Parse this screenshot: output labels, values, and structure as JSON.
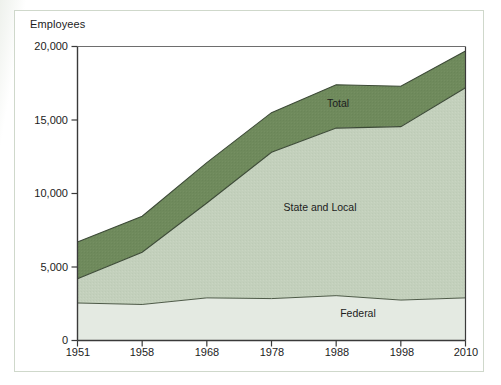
{
  "figure": {
    "axis_title": "Employees"
  },
  "chart_data": {
    "type": "area",
    "title": "Employees",
    "subtitle": "",
    "xlabel": "",
    "ylabel": "Employees",
    "stacked": true,
    "grid": false,
    "legend_position": "inline-annotations",
    "x": [
      1951,
      1958,
      1968,
      1978,
      1988,
      1998,
      2010
    ],
    "xtick_labels": [
      "1951",
      "1958",
      "1968",
      "1978",
      "1988",
      "1998",
      "2010"
    ],
    "xlim": [
      1951,
      2010
    ],
    "ylim": [
      0,
      20000
    ],
    "ytick_labels": [
      "0",
      "5,000",
      "10,000",
      "15,000",
      "20,000"
    ],
    "ytick_values": [
      0,
      5000,
      10000,
      15000,
      20000
    ],
    "series": [
      {
        "name": "Federal",
        "color": "#e4eae2",
        "values": [
          2550,
          2450,
          2900,
          2850,
          3050,
          2750,
          2900
        ]
      },
      {
        "name": "State and Local",
        "color": "#c3d0bc",
        "values": [
          1650,
          3550,
          6450,
          9950,
          11400,
          11800,
          14300
        ]
      },
      {
        "name": "Total",
        "color": "#6f8a5c",
        "values": [
          2500,
          2450,
          2750,
          2700,
          2950,
          2750,
          2500
        ]
      }
    ],
    "cumulative": {
      "federal_top": [
        2550,
        2450,
        2900,
        2850,
        3050,
        2750,
        2900
      ],
      "state_and_local_top": [
        4200,
        6000,
        9350,
        12800,
        14450,
        14550,
        17200
      ],
      "total_top": [
        6700,
        8450,
        12100,
        15500,
        17400,
        17300,
        19700
      ]
    },
    "annotations": [
      {
        "text": "Total",
        "x": 1983,
        "y": 16000
      },
      {
        "text": "State and Local",
        "x": 1981,
        "y": 9600
      },
      {
        "text": "Federal",
        "x": 1992,
        "y": 1300
      }
    ],
    "colors": {
      "total_band": "#6f8a5c",
      "state_and_local_band": "#c3d0bc",
      "federal_band": "#e4eae2",
      "axis": "#3a3a3a",
      "frame": "#cfd8cb",
      "text": "#1c1c1c"
    }
  }
}
